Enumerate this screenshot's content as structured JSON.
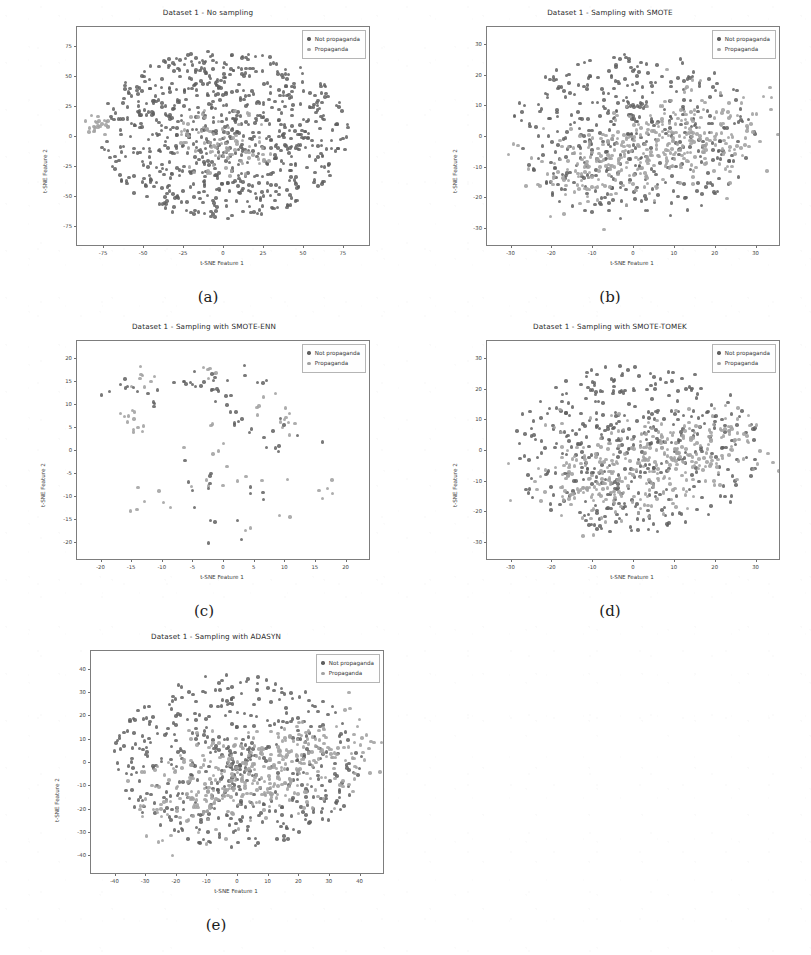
{
  "figure": {
    "background": "#ffffff",
    "legend_labels": [
      "Not propaganda",
      "Propaganda"
    ],
    "colors": {
      "class_not_propaganda": "#5f5f5f",
      "class_propaganda": "#a2a2a2",
      "axis": "#7d7d7d",
      "text": "#2a2a2a"
    },
    "xlabel": "t-SNE Feature 1",
    "ylabel": "t-SNE Feature 2"
  },
  "panels": [
    {
      "key": "a",
      "caption": "(a)",
      "title": "Dataset 1 - No sampling",
      "xlabel": "t-SNE Feature 1",
      "ylabel": "t-SNE Feature 2",
      "xticks": [
        -75,
        -50,
        -25,
        0,
        25,
        50,
        75
      ],
      "yticks": [
        75,
        50,
        25,
        0,
        -25,
        -50,
        -75
      ],
      "xlim": [
        -92,
        92
      ],
      "ylim": [
        -92,
        92
      ],
      "n_points": 900,
      "minority_fraction": 0.13,
      "seed": 11,
      "shape": "blob",
      "minority_mode": "core"
    },
    {
      "key": "b",
      "caption": "(b)",
      "title": "Dataset 1 - Sampling with SMOTE",
      "xlabel": "t-SNE Feature 1",
      "ylabel": "t-SNE Feature 2",
      "xticks": [
        -30,
        -20,
        -10,
        0,
        10,
        20,
        30
      ],
      "yticks": [
        30,
        20,
        10,
        0,
        -10,
        -20,
        -30
      ],
      "xlim": [
        -36,
        36
      ],
      "ylim": [
        -36,
        36
      ],
      "n_points": 820,
      "minority_fraction": 0.48,
      "seed": 23,
      "shape": "blob",
      "minority_mode": "band"
    },
    {
      "key": "c",
      "caption": "(c)",
      "title": "Dataset 1 - Sampling with SMOTE-ENN",
      "xlabel": "t-SNE Feature 1",
      "ylabel": "t-SNE Feature 2",
      "xticks": [
        -20,
        -15,
        -10,
        -5,
        0,
        5,
        10,
        15,
        20
      ],
      "yticks": [
        20,
        15,
        10,
        5,
        0,
        -5,
        -10,
        -15,
        -20
      ],
      "xlim": [
        -24,
        24
      ],
      "ylim": [
        -24,
        24
      ],
      "n_points": 150,
      "minority_fraction": 0.5,
      "seed": 37,
      "shape": "sparse",
      "minority_mode": "cluster"
    },
    {
      "key": "d",
      "caption": "(d)",
      "title": "Dataset 1 - Sampling with SMOTE-TOMEK",
      "xlabel": "t-SNE Feature 1",
      "ylabel": "t-SNE Feature 2",
      "xticks": [
        -30,
        -20,
        -10,
        0,
        10,
        20,
        30
      ],
      "yticks": [
        30,
        20,
        10,
        0,
        -10,
        -20,
        -30
      ],
      "xlim": [
        -36,
        36
      ],
      "ylim": [
        -36,
        36
      ],
      "n_points": 800,
      "minority_fraction": 0.47,
      "seed": 53,
      "shape": "blob",
      "minority_mode": "band"
    },
    {
      "key": "e",
      "caption": "(e)",
      "title": "Dataset 1 - Sampling with ADASYN",
      "xlabel": "t-SNE Feature 1",
      "ylabel": "t-SNE Feature 2",
      "xticks": [
        -40,
        -30,
        -20,
        -10,
        0,
        10,
        20,
        30,
        40
      ],
      "yticks": [
        40,
        30,
        20,
        10,
        0,
        -10,
        -20,
        -30,
        -40
      ],
      "xlim": [
        -48,
        48
      ],
      "ylim": [
        -48,
        48
      ],
      "n_points": 900,
      "minority_fraction": 0.46,
      "seed": 71,
      "shape": "blob",
      "minority_mode": "band"
    }
  ],
  "chart_data": {
    "type": "scatter",
    "xlabel": "t-SNE Feature 1",
    "ylabel": "t-SNE Feature 2",
    "legend": [
      "Not propaganda",
      "Propaganda"
    ],
    "legend_position": "upper right",
    "grid": false,
    "subplots": [
      {
        "caption": "(a)",
        "title": "Dataset 1 - No sampling",
        "xlim": [
          -92,
          92
        ],
        "ylim": [
          -92,
          92
        ],
        "xticks": [
          -75,
          -50,
          -25,
          0,
          25,
          50,
          75
        ],
        "yticks": [
          -75,
          -50,
          -25,
          0,
          25,
          50,
          75
        ],
        "series": [
          {
            "name": "Not propaganda",
            "approx_count": 780,
            "color": "#5f5f5f",
            "distribution": "dense radial blob centered near (0,0), radius ~75"
          },
          {
            "name": "Propaganda",
            "approx_count": 120,
            "color": "#a2a2a2",
            "distribution": "overlapping core cluster near (0,-5) plus small satellite cluster near (-80,10)"
          }
        ]
      },
      {
        "caption": "(b)",
        "title": "Dataset 1 - Sampling with SMOTE",
        "xlim": [
          -36,
          36
        ],
        "ylim": [
          -36,
          36
        ],
        "xticks": [
          -30,
          -20,
          -10,
          0,
          10,
          20,
          30
        ],
        "yticks": [
          -30,
          -20,
          -10,
          0,
          10,
          20,
          30
        ],
        "series": [
          {
            "name": "Not propaganda",
            "approx_count": 430,
            "color": "#5f5f5f",
            "distribution": "dense blob centered (0,2), radius ~28"
          },
          {
            "name": "Propaganda",
            "approx_count": 390,
            "color": "#a2a2a2",
            "distribution": "balanced overlay concentrated in centre-right band around (4,-4)"
          }
        ]
      },
      {
        "caption": "(c)",
        "title": "Dataset 1 - Sampling with SMOTE-ENN",
        "xlim": [
          -24,
          24
        ],
        "ylim": [
          -24,
          24
        ],
        "xticks": [
          -20,
          -15,
          -10,
          -5,
          0,
          5,
          10,
          15,
          20
        ],
        "yticks": [
          -20,
          -15,
          -10,
          -5,
          0,
          5,
          10,
          15,
          20
        ],
        "series": [
          {
            "name": "Not propaganda",
            "approx_count": 75,
            "color": "#5f5f5f",
            "distribution": "sparse scattered small clusters after ENN cleaning"
          },
          {
            "name": "Propaganda",
            "approx_count": 75,
            "color": "#a2a2a2",
            "distribution": "sparse tight clusters, clear separation between groups"
          }
        ]
      },
      {
        "caption": "(d)",
        "title": "Dataset 1 - Sampling with SMOTE-TOMEK",
        "xlim": [
          -36,
          36
        ],
        "ylim": [
          -36,
          36
        ],
        "xticks": [
          -30,
          -20,
          -10,
          0,
          10,
          20,
          30
        ],
        "yticks": [
          -30,
          -20,
          -10,
          0,
          10,
          20,
          30
        ],
        "series": [
          {
            "name": "Not propaganda",
            "approx_count": 425,
            "color": "#5f5f5f",
            "distribution": "dense blob centered (0,2), radius ~28"
          },
          {
            "name": "Propaganda",
            "approx_count": 375,
            "color": "#a2a2a2",
            "distribution": "balanced overlay concentrated centre-right around (4,-4)"
          }
        ]
      },
      {
        "caption": "(e)",
        "title": "Dataset 1 - Sampling with ADASYN",
        "xlim": [
          -48,
          48
        ],
        "ylim": [
          -48,
          48
        ],
        "xticks": [
          -40,
          -30,
          -20,
          -10,
          0,
          10,
          20,
          30,
          40
        ],
        "yticks": [
          -40,
          -30,
          -20,
          -10,
          0,
          10,
          20,
          30,
          40
        ],
        "series": [
          {
            "name": "Not propaganda",
            "approx_count": 486,
            "color": "#5f5f5f",
            "distribution": "dense blob centered (0,0), radius ~40"
          },
          {
            "name": "Propaganda",
            "approx_count": 414,
            "color": "#a2a2a2",
            "distribution": "diagonal band of synthetic points through the core from (-20,-15) to (20,10)"
          }
        ]
      }
    ]
  }
}
